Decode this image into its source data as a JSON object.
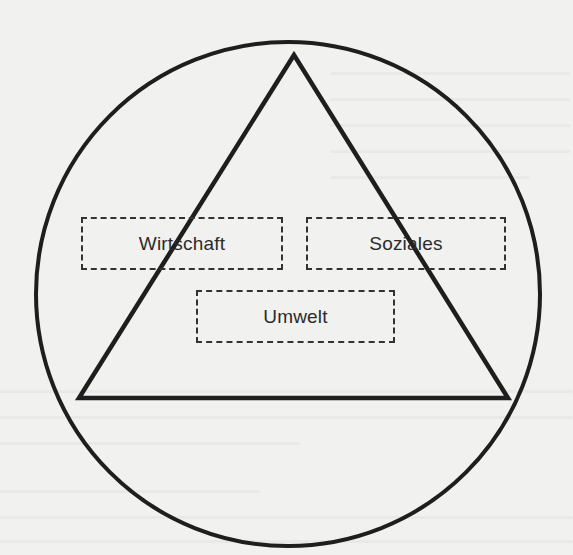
{
  "diagram": {
    "type": "sustainability-triangle",
    "shapes": {
      "outer_circle": {
        "cx": 288,
        "cy": 294,
        "r": 252,
        "stroke": "#1e1e1e"
      },
      "triangle": {
        "points": [
          [
            294,
            55
          ],
          [
            79,
            398
          ],
          [
            508,
            398
          ]
        ],
        "stroke": "#1e1e1e"
      }
    },
    "labels": [
      {
        "id": "wirtschaft",
        "text": "Wirtschaft"
      },
      {
        "id": "soziales",
        "text": "Soziales"
      },
      {
        "id": "umwelt",
        "text": "Umwelt"
      }
    ],
    "colors": {
      "background": "#f1f1ef",
      "stroke": "#1e1e1e",
      "text": "#2b2b2b"
    }
  }
}
